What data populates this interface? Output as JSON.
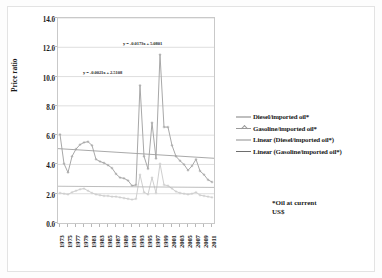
{
  "figure": {
    "footnote_line1": "*Oil at current",
    "footnote_line2": "US$"
  },
  "legend": {
    "position": "right",
    "items": [
      {
        "label": "Diesel/imported oil*",
        "color": "#bfbfbf",
        "marker": "line"
      },
      {
        "label": "Gasoline/imported oil*",
        "color": "#9a9a9a",
        "marker": "plus"
      },
      {
        "label": "Linear (Diesel/imported oil*)",
        "color": "#c6c6c6",
        "marker": "line"
      },
      {
        "label": "Linear (Gasoline/imported oil*)",
        "color": "#6e6e6e",
        "marker": "line"
      }
    ]
  },
  "annotations": {
    "diesel_trend_eq": "y = -0.0173x + 5.0801",
    "gasoline_trend_eq": "y = -0.0021x + 2.5108"
  },
  "chart_data": {
    "type": "line",
    "title": "",
    "xlabel": "",
    "ylabel": "Price ratio",
    "ylim": [
      0.0,
      14.0
    ],
    "yticks": [
      "0.0",
      "2.0",
      "4.0",
      "6.0",
      "8.0",
      "10.0",
      "12.0",
      "14.0"
    ],
    "ytick_values": [
      0,
      2,
      4,
      6,
      8,
      10,
      12,
      14
    ],
    "grid": true,
    "grid_axis": "y",
    "x": [
      1973,
      1974,
      1975,
      1976,
      1977,
      1978,
      1979,
      1980,
      1981,
      1982,
      1983,
      1984,
      1985,
      1986,
      1987,
      1988,
      1989,
      1990,
      1991,
      1992,
      1993,
      1994,
      1995,
      1996,
      1997,
      1998,
      1999,
      2000,
      2001,
      2002,
      2003,
      2004,
      2005,
      2006,
      2007,
      2008,
      2009,
      2010,
      2011
    ],
    "xtick_labels": [
      "1973",
      "1975",
      "1977",
      "1979",
      "1981",
      "1983",
      "1985",
      "1987",
      "1989",
      "1991",
      "1993",
      "1995",
      "1997",
      "1999",
      "2001",
      "2003",
      "2005",
      "2007",
      "2009",
      "2011"
    ],
    "xlim": [
      1973,
      2011
    ],
    "series": [
      {
        "name": "Diesel/imported oil*",
        "color": "#a8a8a8",
        "values": [
          6.05,
          4.05,
          3.45,
          4.55,
          5.05,
          5.35,
          5.5,
          5.55,
          5.3,
          4.35,
          4.2,
          4.1,
          3.95,
          3.75,
          3.35,
          3.1,
          3.05,
          2.9,
          2.55,
          2.6,
          9.4,
          4.55,
          3.7,
          6.85,
          4.4,
          11.5,
          6.55,
          6.55,
          5.3,
          4.55,
          4.25,
          4.0,
          3.6,
          3.9,
          4.35,
          3.55,
          3.3,
          2.95,
          2.8
        ]
      },
      {
        "name": "Gasoline/imported oil*",
        "color": "#cfcfcf",
        "values": [
          2.05,
          2.0,
          1.95,
          2.1,
          2.2,
          2.3,
          2.35,
          2.2,
          2.05,
          1.95,
          1.9,
          1.85,
          1.85,
          1.8,
          1.8,
          1.75,
          1.7,
          1.65,
          1.6,
          1.65,
          3.3,
          2.1,
          1.95,
          3.1,
          2.05,
          4.05,
          2.6,
          2.55,
          2.35,
          2.15,
          2.05,
          2.0,
          1.95,
          2.0,
          2.1,
          1.9,
          1.85,
          1.8,
          1.75
        ]
      }
    ],
    "trendlines": [
      {
        "name": "Linear (Diesel/imported oil*)",
        "color": "#9f9f9f",
        "equation": "y = -0.0173x + 5.0801",
        "slope": -0.0173,
        "intercept": 5.0801,
        "y_start": 5.08,
        "y_end": 4.42
      },
      {
        "name": "Linear (Gasoline/imported oil*)",
        "color": "#b5b5b5",
        "equation": "y = -0.0021x + 2.5108",
        "slope": -0.0021,
        "intercept": 2.5108,
        "y_start": 2.51,
        "y_end": 2.43
      }
    ]
  }
}
